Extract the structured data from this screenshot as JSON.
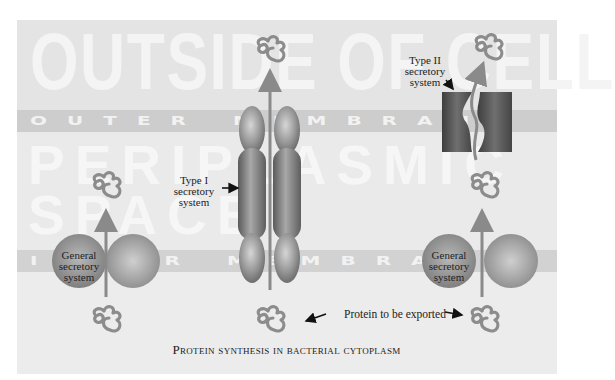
{
  "diagram": {
    "regions": {
      "outside": "OUTSIDE OF CELL",
      "outer_membrane": "OUTER MEMBRANE",
      "periplasm": "PERIPLASMIC SPACE",
      "inner_membrane": "INNER MEMBRANE"
    },
    "labels": {
      "type1": "Type I\nsecretory\nsystem",
      "type2": "Type II\nsecretory\nsystem",
      "general_left": "General\nsecretory\nsystem",
      "general_right": "General\nsecretory\nsystem",
      "protein_exported": "Protein to be exported"
    },
    "caption": "Protein synthesis in bacterial cytoplasm",
    "colors": {
      "background": "#e6e6e6",
      "outer_band": "#cfcfcf",
      "inner_band": "#d4d4d4",
      "cytoplasm": "#e9e9e9",
      "arrow": "#8a8a8a",
      "protein": "#888888",
      "channel_dark": "#5a5a5a"
    }
  }
}
